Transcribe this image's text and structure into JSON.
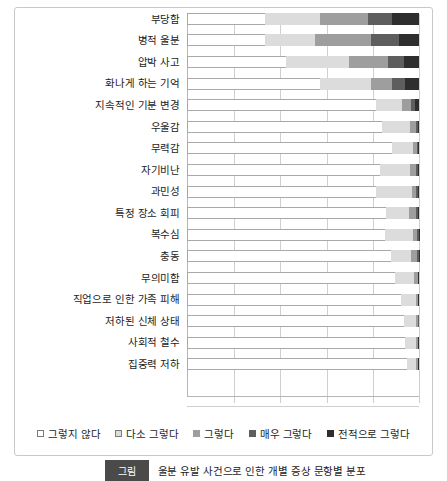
{
  "chart_data": {
    "type": "bar",
    "orientation": "horizontal",
    "stacked": true,
    "normalized_percent": true,
    "title": "",
    "xlabel": "",
    "ylabel": "",
    "xlim": [
      0,
      100
    ],
    "grid": true,
    "gridline_values": [
      0,
      20,
      40,
      60,
      80,
      100
    ],
    "legend_position": "bottom",
    "categories": [
      "부당함",
      "병적 울분",
      "압박 사고",
      "화나게 하는 기억",
      "지속적인 기분 변경",
      "우울감",
      "무력감",
      "자기비난",
      "과민성",
      "특정 장소 회피",
      "복수심",
      "충동",
      "무의미함",
      "직업으로 인한 가족 피해",
      "저하된 신체 상태",
      "사회적 철수",
      "집중력 저하"
    ],
    "series": [
      {
        "name": "그렇지 않다",
        "color": "#ffffff",
        "values": [
          33.5,
          33.5,
          42.5,
          57.5,
          81.5,
          84.0,
          92.0,
          96.5,
          99.5,
          114.0,
          118.5,
          134.5,
          145.5,
          162.5,
          169.5,
          174.5,
          182.0
        ]
      },
      {
        "name": "다소 그렇다",
        "color": "#dcdcdc",
        "values": [
          24.0,
          21.5,
          27.5,
          22.0,
          11.0,
          12.0,
          9.5,
          15.0,
          19.0,
          13.5,
          17.0,
          13.5,
          13.0,
          11.0,
          9.0,
          9.0,
          7.5
        ]
      },
      {
        "name": "그렇다",
        "color": "#9e9e9e",
        "values": [
          20.5,
          24.5,
          16.5,
          9.0,
          4.0,
          2.5,
          1.5,
          3.0,
          2.0,
          4.0,
          2.5,
          4.0,
          2.5,
          1.5,
          2.0,
          1.5,
          1.5
        ]
      },
      {
        "name": "매우 그렇다",
        "color": "#5e5e5e",
        "values": [
          10.5,
          12.0,
          7.0,
          5.5,
          2.0,
          1.0,
          0.8,
          0.8,
          0.8,
          1.0,
          0.8,
          0.8,
          0.5,
          0.5,
          0.5,
          0.5,
          0.5
        ]
      },
      {
        "name": "전적으로 그렇다",
        "color": "#2e2e2e",
        "values": [
          11.5,
          8.5,
          6.5,
          6.0,
          1.5,
          0.5,
          0.3,
          0.7,
          0.7,
          0.5,
          0.2,
          0.2,
          0.5,
          0.5,
          0.0,
          0.5,
          0.5
        ]
      }
    ]
  },
  "legend": {
    "items": [
      {
        "label": "그렇지 않다",
        "swatch": "k0"
      },
      {
        "label": "다소 그렇다",
        "swatch": "k1"
      },
      {
        "label": "그렇다",
        "swatch": "k2"
      },
      {
        "label": "매우 그렇다",
        "swatch": "k3"
      },
      {
        "label": "전적으로 그렇다",
        "swatch": "k4"
      }
    ]
  },
  "caption": {
    "tag": "그림",
    "text": "울분 유발 사건으로 인한 개별 증상 문항별 분포"
  }
}
